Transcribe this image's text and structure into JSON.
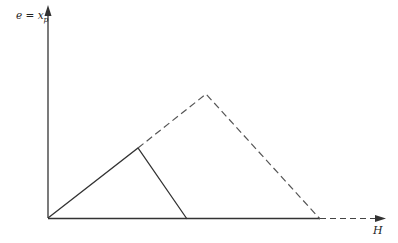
{
  "axes": {
    "y_label": "e = x",
    "y_label_subscript": "p",
    "x_label": "H"
  },
  "colors": {
    "line": "#333333",
    "dashed": "#555555",
    "background": "#ffffff"
  },
  "geometry": {
    "origin": [
      48,
      218
    ],
    "solid_peak": [
      138,
      148
    ],
    "solid_end": [
      187,
      219
    ],
    "dashed_peak": [
      206,
      94
    ],
    "dashed_end": [
      320,
      219
    ]
  }
}
